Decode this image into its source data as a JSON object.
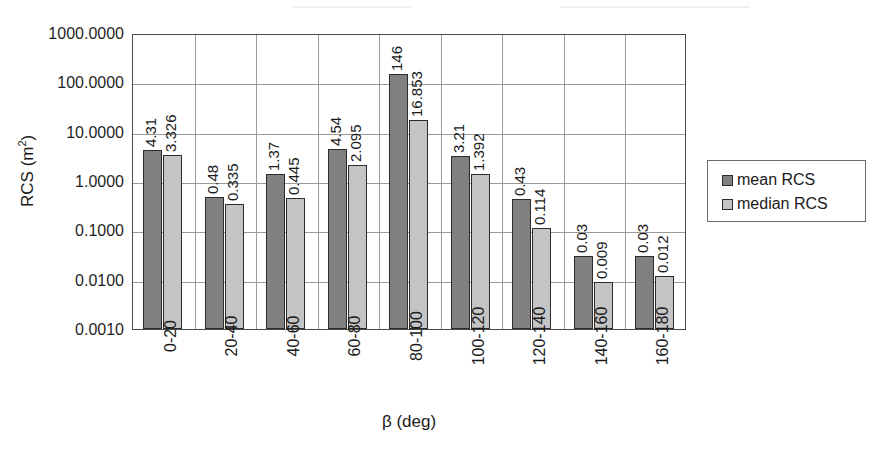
{
  "chart_data": {
    "type": "bar",
    "title": "",
    "subtitle": "",
    "xlabel": "β (deg)",
    "ylabel": "RCS (m²)",
    "yscale": "log",
    "ylim": [
      0.001,
      1000
    ],
    "ytick_labels": [
      "1000.0000",
      "100.0000",
      "10.0000",
      "1.0000",
      "0.1000",
      "0.0100",
      "0.0010"
    ],
    "ytick_values": [
      1000,
      100,
      10,
      1,
      0.1,
      0.01,
      0.001
    ],
    "grid": "horizontal-and-category-vertical",
    "legend_position": "right",
    "categories": [
      "0-20",
      "20-40",
      "40-60",
      "60-80",
      "80-100",
      "100-120",
      "120-140",
      "140-160",
      "160-180"
    ],
    "series": [
      {
        "name": "mean RCS",
        "color": "#808080",
        "values": [
          4.31,
          0.48,
          1.37,
          4.54,
          146,
          3.21,
          0.43,
          0.03,
          0.03
        ],
        "labels": [
          "4.31",
          "0.48",
          "1.37",
          "4.54",
          "146",
          "3.21",
          "0.43",
          "0.03",
          "0.03"
        ]
      },
      {
        "name": "median RCS",
        "color": "#c4c4c4",
        "values": [
          3.326,
          0.335,
          0.445,
          2.095,
          16.853,
          1.392,
          0.114,
          0.009,
          0.012
        ],
        "labels": [
          "3.326",
          "0.335",
          "0.445",
          "2.095",
          "16.853",
          "1.392",
          "0.114",
          "0.009",
          "0.012"
        ]
      }
    ]
  },
  "legend": {
    "items": [
      {
        "label": "mean RCS",
        "color": "#808080"
      },
      {
        "label": "median RCS",
        "color": "#c4c4c4"
      }
    ]
  },
  "axes": {
    "y_title_main": "RCS (m",
    "y_title_sup": "2",
    "y_title_close": ")",
    "x_title": "β (deg)"
  }
}
